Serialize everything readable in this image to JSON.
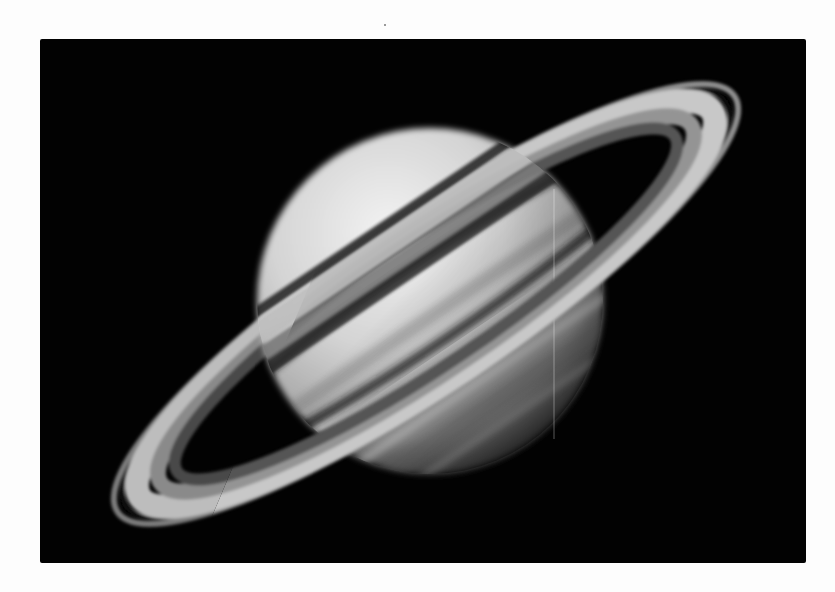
{
  "image": {
    "subject": "Saturn with rings",
    "style": "grayscale astronomical photograph",
    "background_color": "#020202",
    "page_color": "#fdfdfd"
  },
  "colors": {
    "planet_light": "#eeeeee",
    "planet_mid": "#b9b9b9",
    "planet_dark": "#6e6e6e",
    "ring_bright": "#c8c8c8",
    "ring_mid": "#8f8f8f",
    "ring_gap": "#0a0a0a"
  }
}
